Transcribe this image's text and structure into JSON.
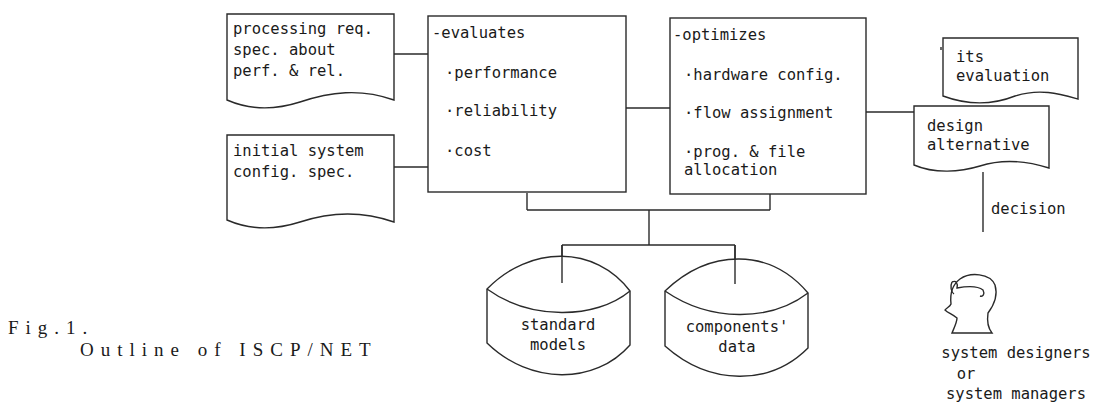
{
  "diagram": {
    "inputs": [
      {
        "lines": [
          "processing req.",
          " spec. about",
          " perf. & rel."
        ]
      },
      {
        "lines": [
          "initial system",
          " config. spec."
        ]
      }
    ],
    "evaluator": {
      "header": "-evaluates",
      "items": [
        "·performance",
        "·reliability",
        "·cost"
      ]
    },
    "optimizer": {
      "header": "-optimizes",
      "items": [
        "·hardware config.",
        "·flow assignment",
        "·prog. & file",
        " allocation"
      ]
    },
    "outputs": {
      "evaluation": {
        "lines": [
          "its",
          "evaluation"
        ]
      },
      "alternative": {
        "lines": [
          "design",
          "alternative"
        ]
      },
      "decision_label": "decision"
    },
    "databases": [
      {
        "lines": [
          "standard",
          "models"
        ]
      },
      {
        "lines": [
          "components'",
          "data"
        ]
      }
    ],
    "actor": {
      "icon": "person-head-icon",
      "lines": [
        "system designers",
        "or",
        "system managers"
      ]
    },
    "caption": {
      "line1": "Fig.1.",
      "line2": "Outline of ISCP/NET"
    }
  }
}
